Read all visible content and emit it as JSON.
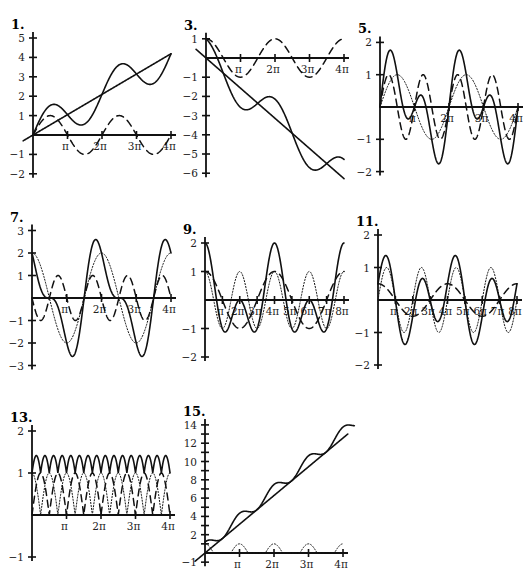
{
  "chart_data": [
    {
      "id": "1",
      "title": "1.",
      "type": "line",
      "origin_px": [
        33,
        135
      ],
      "x_end_px": 171,
      "unit_px": 19.4,
      "xlim": [
        0,
        12.566
      ],
      "ylim": [
        -2,
        5
      ],
      "x_ticks": [
        "π",
        "2π",
        "3π",
        "4π"
      ],
      "y_ticks": [
        5,
        4,
        3,
        2,
        1,
        -1,
        -2
      ],
      "series": [
        {
          "name": "t/3",
          "style": "solid",
          "expr": "t/3",
          "t_from": -0.9
        },
        {
          "name": "sin t",
          "style": "dashed",
          "expr": "Math.sin(t)"
        },
        {
          "name": "t/3 + sin t",
          "style": "solid",
          "expr": "t/3+Math.sin(t)"
        }
      ]
    },
    {
      "id": "3",
      "title": "3.",
      "type": "line",
      "origin_px": [
        206,
        58
      ],
      "x_end_px": 344,
      "unit_px": 19.2,
      "xlim": [
        0,
        12.566
      ],
      "ylim": [
        -6,
        1
      ],
      "x_ticks": [
        "π",
        "2π",
        "3π",
        "4π"
      ],
      "y_ticks": [
        1,
        -1,
        -2,
        -3,
        -4,
        -5,
        -6
      ],
      "series": [
        {
          "name": "-t/2",
          "style": "solid",
          "expr": "-t/2",
          "t_from": -0.9
        },
        {
          "name": "cos t",
          "style": "dashed",
          "expr": "Math.cos(t)"
        },
        {
          "name": "-t/2 + cos t",
          "style": "solid",
          "expr": "-t/2+Math.cos(t)"
        }
      ]
    },
    {
      "id": "5",
      "title": "5.",
      "type": "line",
      "origin_px": [
        380,
        107
      ],
      "x_end_px": 518,
      "unit_px": 32.3,
      "xlim": [
        0,
        12.566
      ],
      "ylim": [
        -2,
        2
      ],
      "x_ticks": [
        "π",
        "2π",
        "3π",
        "4π"
      ],
      "y_ticks": [
        2,
        1,
        -1,
        -2
      ],
      "series": [
        {
          "name": "sin t",
          "style": "dotted",
          "expr": "Math.sin(t)"
        },
        {
          "name": "sin 2t",
          "style": "dashed",
          "expr": "Math.sin(2*t)"
        },
        {
          "name": "sin t + sin 2t",
          "style": "solid",
          "expr": "Math.sin(t)+Math.sin(2*t)"
        }
      ]
    },
    {
      "id": "7",
      "title": "7.",
      "type": "line",
      "origin_px": [
        32,
        298
      ],
      "x_end_px": 171,
      "unit_px": 22.5,
      "xlim": [
        0,
        12.566
      ],
      "ylim": [
        -3,
        3
      ],
      "x_ticks": [
        "π",
        "2π",
        "3π",
        "4π"
      ],
      "y_ticks": [
        3,
        2,
        1,
        -1,
        -2,
        -3
      ],
      "series": [
        {
          "name": "2cos t",
          "style": "dotted",
          "expr": "2*Math.cos(t)"
        },
        {
          "name": "-sin 2t",
          "style": "dashed",
          "expr": "-Math.sin(2*t)"
        },
        {
          "name": "2cos t - sin 2t",
          "style": "solid",
          "expr": "2*Math.cos(t)-Math.sin(2*t)"
        }
      ]
    },
    {
      "id": "9",
      "title": "9.",
      "type": "line",
      "origin_px": [
        205,
        300
      ],
      "x_end_px": 344,
      "unit_px": 28.5,
      "xlim": [
        0,
        25.133
      ],
      "ylim": [
        -2,
        2
      ],
      "x_ticks": [
        "π",
        "2π",
        "3π",
        "4π",
        "5π",
        "6π",
        "7π",
        "8π"
      ],
      "y_ticks": [
        2,
        1,
        -1,
        -2
      ],
      "series": [
        {
          "name": "cos t",
          "style": "dotted",
          "expr": "Math.cos(t)"
        },
        {
          "name": "cos(t/2)",
          "style": "dashed",
          "expr": "Math.cos(t/2)"
        },
        {
          "name": "cos t + cos(t/2)",
          "style": "solid",
          "expr": "Math.cos(t)+Math.cos(t/2)"
        }
      ]
    },
    {
      "id": "11",
      "title": "11.",
      "type": "line",
      "origin_px": [
        378,
        300
      ],
      "x_end_px": 517,
      "unit_px": 32.5,
      "xlim": [
        0,
        25.133
      ],
      "ylim": [
        -2,
        2
      ],
      "x_ticks": [
        "π",
        "2π",
        "3π",
        "4π",
        "5π",
        "6π",
        "7π",
        "8π"
      ],
      "y_ticks": [
        2,
        1,
        -1,
        -2
      ],
      "series": [
        {
          "name": "sin t",
          "style": "dotted",
          "expr": "Math.sin(t)"
        },
        {
          "name": "0.5 cos(t/2)",
          "style": "dashed",
          "expr": "0.5*Math.cos(t/2)"
        },
        {
          "name": "sin t + 0.5 cos(t/2)",
          "style": "solid",
          "expr": "Math.sin(t)+0.5*Math.cos(t/2)"
        }
      ]
    },
    {
      "id": "13",
      "title": "13.",
      "type": "line",
      "origin_px": [
        32,
        515
      ],
      "x_end_px": 170,
      "unit_px": 42,
      "xlim": [
        0,
        12.566
      ],
      "ylim": [
        -1,
        2
      ],
      "x_ticks": [
        "π",
        "2π",
        "3π",
        "4π"
      ],
      "y_ticks": [
        2,
        1,
        -1
      ],
      "series": [
        {
          "name": "|cos 2t|",
          "style": "dotted",
          "expr": "Math.abs(Math.cos(2*t))"
        },
        {
          "name": "|sin 2t|",
          "style": "dashed",
          "expr": "Math.abs(Math.sin(2*t))"
        },
        {
          "name": "|sin 2t| + |cos 2t|",
          "style": "solid",
          "expr": "Math.abs(Math.sin(2*t))+Math.abs(Math.cos(2*t))"
        }
      ]
    },
    {
      "id": "15",
      "title": "15.",
      "type": "line",
      "origin_px": [
        205,
        553
      ],
      "x_end_px": 343,
      "unit_px": 9.15,
      "xlim": [
        0,
        12.566
      ],
      "ylim": [
        -1,
        14
      ],
      "x_ticks": [
        "π",
        "2π",
        "3π",
        "4π"
      ],
      "y_ticks": [
        14,
        13,
        12,
        11,
        10,
        9,
        8,
        7,
        6,
        5,
        4,
        3,
        2,
        1,
        -1
      ],
      "y_tick_labels": {
        "14": "14",
        "12": "12",
        "10": "10",
        "8": "8",
        "6": "6",
        "4": "4",
        "2": "2",
        "-1": "−1"
      },
      "series": [
        {
          "name": "t",
          "style": "solid",
          "expr": "t",
          "t_from": -0.9,
          "t_to": 13.0
        },
        {
          "name": "bumps",
          "style": "dotted",
          "expr": "Math.max(0,Math.cos(2*t))*1.0"
        },
        {
          "name": "t + bumps",
          "style": "solid",
          "expr": "t+1.2*Math.pow(Math.cos(t),2)",
          "t_to": 13.6
        }
      ]
    }
  ]
}
